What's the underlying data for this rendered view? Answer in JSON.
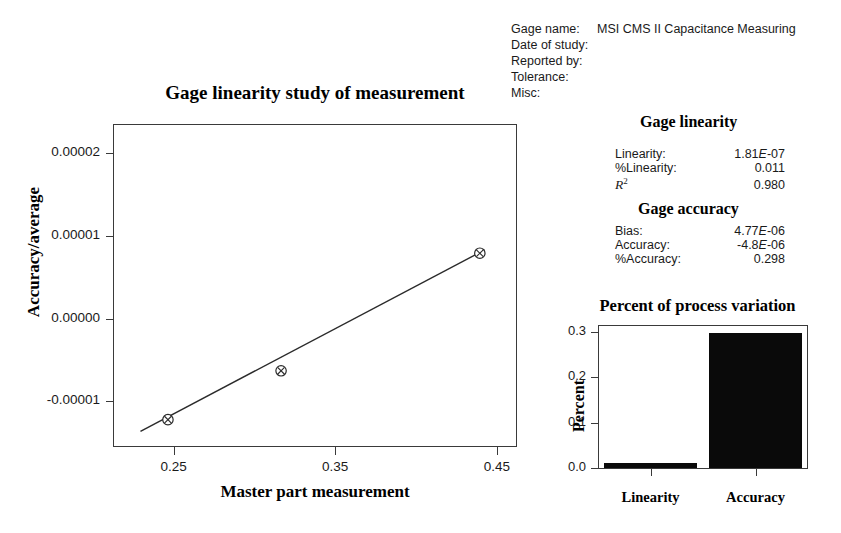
{
  "header": {
    "rows": [
      {
        "label": "Gage name:",
        "value": "MSI CMS II Capacitance Measuring"
      },
      {
        "label": "Date of study:",
        "value": ""
      },
      {
        "label": "Reported by:",
        "value": ""
      },
      {
        "label": "Tolerance:",
        "value": ""
      },
      {
        "label": "Misc:",
        "value": ""
      }
    ]
  },
  "gage_linearity": {
    "heading": "Gage linearity",
    "rows": [
      {
        "name": "Linearity:",
        "value": "1.81E-07"
      },
      {
        "name": "%Linearity:",
        "value": "0.011"
      },
      {
        "name": "R2",
        "value": "0.980"
      }
    ]
  },
  "gage_accuracy": {
    "heading": "Gage accuracy",
    "rows": [
      {
        "name": "Bias:",
        "value": "4.77E-06"
      },
      {
        "name": "Accuracy:",
        "value": "-4.8E-06"
      },
      {
        "name": "%Accuracy:",
        "value": "0.298"
      }
    ]
  },
  "chart_data": [
    {
      "type": "scatter",
      "title": "Gage linearity study of measurement",
      "xlabel": "Master part measurement",
      "ylabel": "Accuracy/average",
      "xlim": [
        0.2125,
        0.4625
      ],
      "ylim": [
        -1.55e-05,
        2.35e-05
      ],
      "xticks": [
        0.25,
        0.35,
        0.45
      ],
      "xtick_labels": [
        "0.25",
        "0.35",
        "0.45"
      ],
      "yticks": [
        2e-05,
        1e-05,
        0.0,
        -1e-05
      ],
      "ytick_labels": [
        "0.00002",
        "0.00001",
        "0.00000",
        "-0.00001"
      ],
      "grid": false,
      "marker": "circle-x",
      "points": [
        {
          "x": 0.2465,
          "y": -1.22e-05
        },
        {
          "x": 0.3165,
          "y": -6.3e-06
        },
        {
          "x": 0.4395,
          "y": 7.9e-06
        }
      ],
      "fit_line": {
        "name": "regression line",
        "x": [
          0.2295,
          0.4425
        ],
        "y": [
          -1.36e-05,
          8.3e-06
        ]
      }
    },
    {
      "type": "bar",
      "title": "Percent of process variation",
      "xlabel": "",
      "ylabel": "Percent",
      "categories": [
        "Linearity",
        "Accuracy"
      ],
      "values": [
        0.011,
        0.298
      ],
      "ylim": [
        0.0,
        0.313
      ],
      "yticks": [
        0.0,
        0.1,
        0.2,
        0.3
      ],
      "ytick_labels": [
        "0.0",
        "0.1",
        "0.2",
        "0.3"
      ],
      "grid": false,
      "bar_color": "#0a0a0a"
    }
  ]
}
